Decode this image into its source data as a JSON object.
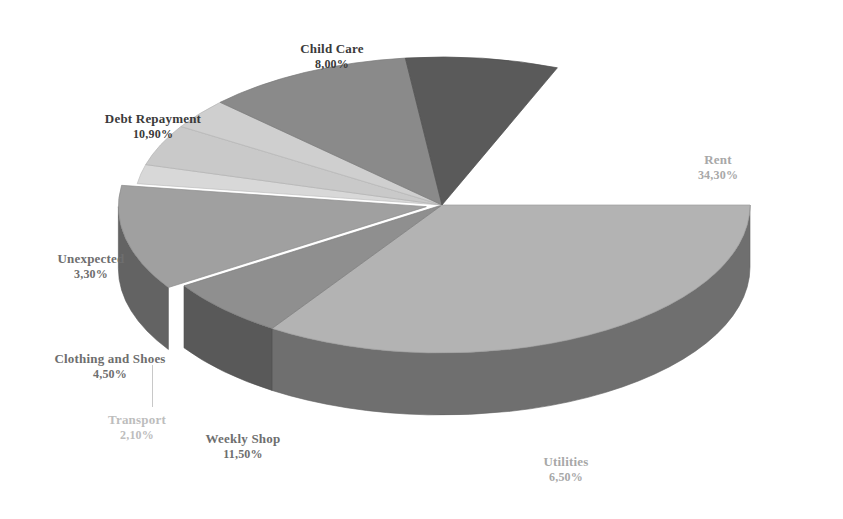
{
  "chart_data": {
    "type": "pie",
    "title": "",
    "three_d": true,
    "legend": "none",
    "labels_position": "outside",
    "value_format": "comma-decimal-percent",
    "categories": [
      "Rent",
      "Utilities",
      "Weekly Shop",
      "Transport",
      "Clothing and Shoes",
      "Unexpected",
      "Debt Repayment",
      "Child Care"
    ],
    "values": [
      34.3,
      6.5,
      11.5,
      2.1,
      4.5,
      3.3,
      10.9,
      8.0
    ],
    "value_labels": [
      "34,30%",
      "6,50%",
      "11,50%",
      "2,10%",
      "4,50%",
      "3,30%",
      "10,90%",
      "8,00%"
    ],
    "unit": "%",
    "total": 81.1,
    "colors": [
      "#b3b3b3",
      "#8f8f8f",
      "#a0a0a0",
      "#d8d8d8",
      "#c9c9c9",
      "#cfcfcf",
      "#8a8a8a",
      "#5a5a5a"
    ],
    "xlabel": "",
    "ylabel": ""
  },
  "chart": {
    "background": "#ffffff",
    "side_wall_color": "#6f6f6f",
    "slices": [
      {
        "name": "Rent",
        "value_label": "34,30%",
        "value": 34.3,
        "color": "#b3b3b3",
        "label_tone": "light",
        "label_x": 718,
        "label_y": 152,
        "start_angle": 0,
        "end_angle": 123.48,
        "exploded": false
      },
      {
        "name": "Utilities",
        "value_label": "6,50%",
        "value": 6.5,
        "color": "#8f8f8f",
        "label_tone": "light",
        "label_x": 566,
        "label_y": 454,
        "start_angle": 123.48,
        "end_angle": 146.89,
        "exploded": false
      },
      {
        "name": "Weekly Shop",
        "value_label": "11,50%",
        "value": 11.5,
        "color": "#a0a0a0",
        "label_tone": "mid",
        "label_x": 243,
        "label_y": 431,
        "start_angle": 146.89,
        "end_angle": 188.29,
        "exploded": true
      },
      {
        "name": "Transport",
        "value_label": "2,10%",
        "value": 2.1,
        "color": "#d8d8d8",
        "label_tone": "pale",
        "label_x": 137,
        "label_y": 412,
        "start_angle": 188.29,
        "end_angle": 195.85,
        "exploded": false
      },
      {
        "name": "Clothing and Shoes",
        "value_label": "4,50%",
        "value": 4.5,
        "color": "#c9c9c9",
        "label_tone": "mid",
        "label_x": 110,
        "label_y": 351,
        "start_angle": 195.85,
        "end_angle": 212.05,
        "exploded": false
      },
      {
        "name": "Unexpected",
        "value_label": "3,30%",
        "value": 3.3,
        "color": "#cfcfcf",
        "label_tone": "mid",
        "label_x": 91,
        "label_y": 251,
        "start_angle": 212.05,
        "end_angle": 223.93,
        "exploded": false
      },
      {
        "name": "Debt Repayment",
        "value_label": "10,90%",
        "value": 10.9,
        "color": "#8a8a8a",
        "label_tone": "dark",
        "label_x": 153,
        "label_y": 111,
        "start_angle": 223.93,
        "end_angle": 263.17,
        "exploded": false
      },
      {
        "name": "Child Care",
        "value_label": "8,00%",
        "value": 8.0,
        "color": "#5a5a5a",
        "label_tone": "dark",
        "label_x": 332,
        "label_y": 41,
        "start_angle": 263.17,
        "end_angle": 292.0,
        "exploded": false
      }
    ]
  }
}
